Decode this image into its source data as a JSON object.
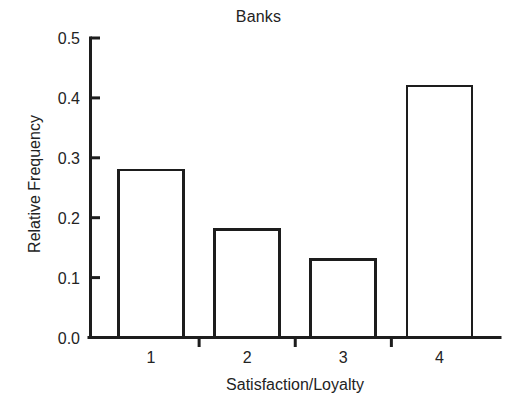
{
  "chart_data": {
    "type": "bar",
    "title": "Banks",
    "xlabel": "Satisfaction/Loyalty",
    "ylabel": "Relative Frequency",
    "categories": [
      "1",
      "2",
      "3",
      "4"
    ],
    "values": [
      0.28,
      0.18,
      0.13,
      0.42
    ],
    "ylim": [
      0.0,
      0.5
    ],
    "xlim": [
      0.5,
      4.5
    ],
    "y_ticks": [
      "0.0",
      "0.1",
      "0.2",
      "0.3",
      "0.4",
      "0.5"
    ],
    "y_tick_values": [
      0.0,
      0.1,
      0.2,
      0.3,
      0.4,
      0.5
    ],
    "x_ticks": [
      "1",
      "2",
      "3",
      "4"
    ],
    "grid": false,
    "legend": null,
    "bar_fill_color": "#ffffff",
    "bar_edge_color": "#1d1d1d",
    "axis_color": "#1d1d1d",
    "background_color": "#ffffff",
    "series": [
      {
        "name": "Relative Frequency",
        "values": [
          0.28,
          0.18,
          0.13,
          0.42
        ]
      }
    ],
    "bars": [
      {
        "category": "1",
        "value": 0.28,
        "label": "0.28"
      },
      {
        "category": "2",
        "value": 0.18,
        "label": "0.18"
      },
      {
        "category": "3",
        "value": 0.13,
        "label": "0.13"
      },
      {
        "category": "4",
        "value": 0.42,
        "label": "0.42"
      }
    ]
  }
}
